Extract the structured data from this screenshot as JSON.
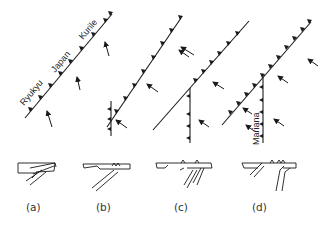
{
  "figure": {
    "panels": [
      {
        "id": "a",
        "label": "(a)",
        "arc_names": [
          "Ryukyu",
          "Japan",
          "Kurile"
        ]
      },
      {
        "id": "b",
        "label": "(b)"
      },
      {
        "id": "c",
        "label": "(c)"
      },
      {
        "id": "d",
        "label": "(d)",
        "branch_name": "Mariana"
      }
    ],
    "colors": {
      "ink": "#1a1a1a",
      "background": "#ffffff"
    }
  }
}
